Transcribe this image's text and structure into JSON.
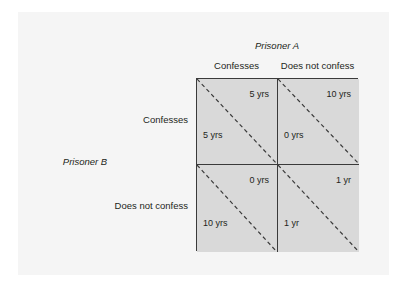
{
  "diagram": {
    "type": "payoff-matrix",
    "column_axis_title": "Prisoner A",
    "row_axis_title": "Prisoner B",
    "column_headers": [
      "Confesses",
      "Does not confess"
    ],
    "row_headers": [
      "Confesses",
      "Does not confess"
    ],
    "cells": [
      {
        "row": "Confesses",
        "column": "Confesses",
        "prisoner_a_payoff": "5 yrs",
        "prisoner_b_payoff": "5 yrs"
      },
      {
        "row": "Confesses",
        "column": "Does not confess",
        "prisoner_a_payoff": "10 yrs",
        "prisoner_b_payoff": "0 yrs"
      },
      {
        "row": "Does not confess",
        "column": "Confesses",
        "prisoner_a_payoff": "0 yrs",
        "prisoner_b_payoff": "10 yrs"
      },
      {
        "row": "Does not confess",
        "column": "Does not confess",
        "prisoner_a_payoff": "1 yr",
        "prisoner_b_payoff": "1 yr"
      }
    ],
    "colors": {
      "page_background": "#ffffff",
      "panel_background": "#f5f5f5",
      "cell_fill": "#d9d9d9",
      "border": "#3a3a3a",
      "text": "#231f20"
    }
  }
}
